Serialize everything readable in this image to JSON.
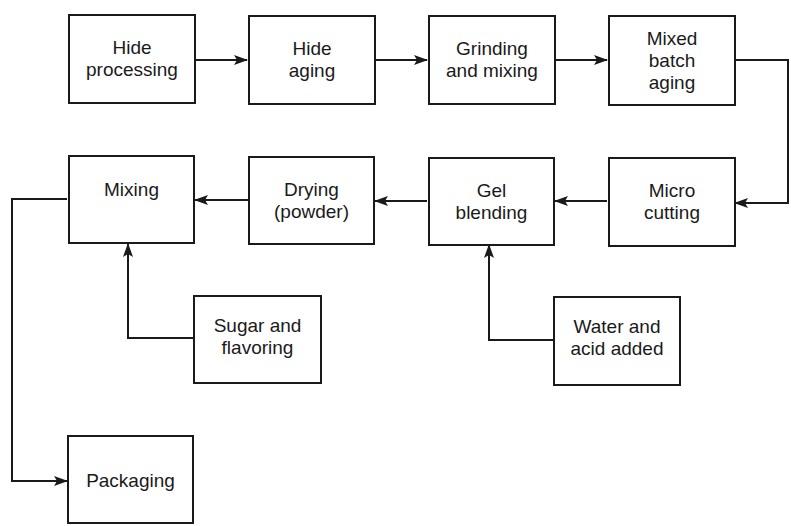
{
  "diagram": {
    "type": "process-flowchart",
    "top_fragment": "( ... cut-off caption text ... )",
    "nodes": {
      "hide_processing": {
        "label": "Hide\nprocessing"
      },
      "hide_aging": {
        "label": "Hide\naging"
      },
      "grinding_mixing": {
        "label": "Grinding\nand mixing"
      },
      "mixed_batch_aging": {
        "label": "Mixed\nbatch\naging"
      },
      "micro_cutting": {
        "label": "Micro\ncutting"
      },
      "gel_blending": {
        "label": "Gel\nblending"
      },
      "drying_powder": {
        "label": "Drying\n(powder)"
      },
      "mixing": {
        "label": "Mixing"
      },
      "water_acid": {
        "label": "Water and\nacid added"
      },
      "sugar_flavoring": {
        "label": "Sugar and\nflavoring"
      },
      "packaging": {
        "label": "Packaging"
      }
    },
    "edges": [
      {
        "from": "Hide processing",
        "to": "Hide aging"
      },
      {
        "from": "Hide aging",
        "to": "Grinding and mixing"
      },
      {
        "from": "Grinding and mixing",
        "to": "Mixed batch aging"
      },
      {
        "from": "Mixed batch aging",
        "to": "Micro cutting"
      },
      {
        "from": "Micro cutting",
        "to": "Gel blending"
      },
      {
        "from": "Water and acid added",
        "to": "Gel blending"
      },
      {
        "from": "Gel blending",
        "to": "Drying (powder)"
      },
      {
        "from": "Drying (powder)",
        "to": "Mixing"
      },
      {
        "from": "Sugar and flavoring",
        "to": "Mixing"
      },
      {
        "from": "Mixing",
        "to": "Packaging"
      }
    ],
    "colors": {
      "line": "#1a1a1a",
      "background": "#ffffff"
    }
  }
}
